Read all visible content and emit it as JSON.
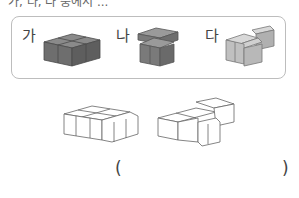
{
  "question": {
    "partial_top_text": "가, 나, 다 중에서 ..."
  },
  "choices": [
    {
      "label": "가",
      "color": "#6f6f6f"
    },
    {
      "label": "나",
      "color": "#8a8a8a"
    },
    {
      "label": "다",
      "color": "#bdbdbd"
    }
  ],
  "target_shapes": [
    {
      "name": "shape-left"
    },
    {
      "name": "shape-right"
    }
  ],
  "answer": {
    "open_paren": "(",
    "close_paren": ")",
    "value": ""
  }
}
